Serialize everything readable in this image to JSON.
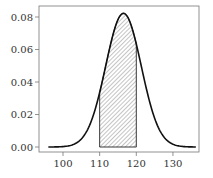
{
  "chart_data": {
    "type": "area",
    "title": "",
    "xlabel": "",
    "ylabel": "",
    "distribution": {
      "mean": 116.5,
      "sd": 4.85
    },
    "shaded_interval": [
      110,
      120
    ],
    "xlim": [
      94.5,
      136.5
    ],
    "ylim": [
      -0.002,
      0.0855
    ],
    "x_ticks": [
      100,
      110,
      120,
      130
    ],
    "x_tick_labels": [
      "100",
      "110",
      "120",
      "130"
    ],
    "y_ticks": [
      0.0,
      0.02,
      0.04,
      0.06,
      0.08
    ],
    "y_tick_labels": [
      "0.00",
      "0.02",
      "0.04",
      "0.06",
      "0.08"
    ],
    "grid": false,
    "legend": null,
    "curve_points": {
      "x": [
        96,
        100,
        104,
        108,
        110,
        112,
        114,
        116,
        116.5,
        118,
        120,
        122,
        124,
        128,
        132,
        136
      ],
      "y": [
        0.0,
        0.0025,
        0.0148,
        0.0482,
        0.0335,
        0.052,
        0.072,
        0.0816,
        0.0823,
        0.0785,
        0.063,
        0.043,
        0.0249,
        0.0049,
        0.0005,
        0.0
      ]
    }
  }
}
